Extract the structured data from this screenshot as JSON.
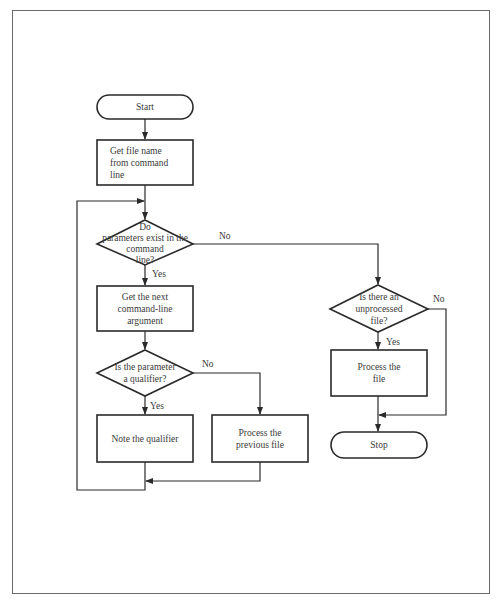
{
  "diagram": {
    "type": "flowchart",
    "nodes": {
      "start": {
        "shape": "terminator",
        "label": "Start"
      },
      "get_file_name": {
        "shape": "process",
        "label": "Get file name\nfrom command\nline"
      },
      "params_exist": {
        "shape": "decision",
        "label": "Do\nparameters exist in the\ncommand\nline?"
      },
      "get_next_arg": {
        "shape": "process",
        "label": "Get the next\ncommand-line\nargument"
      },
      "is_qualifier": {
        "shape": "decision",
        "label": "Is the parameter\na qualifier?"
      },
      "note_qualifier": {
        "shape": "process",
        "label": "Note the qualifier"
      },
      "process_previous": {
        "shape": "process",
        "label": "Process the\nprevious file"
      },
      "unprocessed_file": {
        "shape": "decision",
        "label": "Is there an\nunprocessed\nfile?"
      },
      "process_file": {
        "shape": "process",
        "label": "Process the\nfile"
      },
      "stop": {
        "shape": "terminator",
        "label": "Stop"
      }
    },
    "edges": {
      "params_no": "No",
      "params_yes": "Yes",
      "qualifier_no": "No",
      "qualifier_yes": "Yes",
      "unprocessed_no": "No",
      "unprocessed_yes": "Yes"
    },
    "connections": [
      {
        "from": "start",
        "to": "get_file_name",
        "label": ""
      },
      {
        "from": "get_file_name",
        "to": "params_exist",
        "label": ""
      },
      {
        "from": "params_exist",
        "to": "get_next_arg",
        "label": "Yes"
      },
      {
        "from": "params_exist",
        "to": "unprocessed_file",
        "label": "No"
      },
      {
        "from": "get_next_arg",
        "to": "is_qualifier",
        "label": ""
      },
      {
        "from": "is_qualifier",
        "to": "note_qualifier",
        "label": "Yes"
      },
      {
        "from": "is_qualifier",
        "to": "process_previous",
        "label": "No"
      },
      {
        "from": "note_qualifier",
        "to": "params_exist",
        "label": "loop"
      },
      {
        "from": "process_previous",
        "to": "params_exist",
        "label": "loop"
      },
      {
        "from": "unprocessed_file",
        "to": "process_file",
        "label": "Yes"
      },
      {
        "from": "unprocessed_file",
        "to": "stop",
        "label": "No"
      },
      {
        "from": "process_file",
        "to": "stop",
        "label": ""
      }
    ],
    "colors": {
      "stroke": "#2a2a2a",
      "text": "#3a3a3a",
      "background": "#ffffff",
      "frame": "#6a6a6a"
    }
  }
}
